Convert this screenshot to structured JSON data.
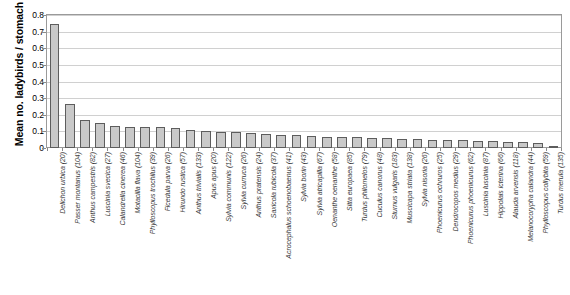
{
  "chart_data": {
    "type": "bar",
    "title": "",
    "subtitle": "",
    "xlabel": "",
    "ylabel": "Mean no. ladybirds / stomach",
    "ylim": [
      0,
      0.8
    ],
    "yticks": [
      "0",
      "0.1",
      "0.2",
      "0.3",
      "0.4",
      "0.5",
      "0.6",
      "0.7",
      "0.8"
    ],
    "ytick_values": [
      0,
      0.1,
      0.2,
      0.3,
      0.4,
      0.5,
      0.6,
      0.7,
      0.8
    ],
    "grid": true,
    "legend": "none",
    "bar_fill_color": "#c9c9c9",
    "bar_edge_color": "#5d5d5d",
    "categories": [
      "Delichon urbica (20)",
      "Passer montanus (104)",
      "Anthus campestris (82)",
      "Luscinia svecica (27)",
      "Calandrella cinerea (46)",
      "Motacilla flava (104)",
      "Phylloscopus trochilus (39)",
      "Ficedula parva (26)",
      "Hirundo rustica (57)",
      "Anthus trivialis (133)",
      "Apus apus (20)",
      "Sylvia communis (122)",
      "Sylvia curruca (26)",
      "Anthus pratensis (24)",
      "Saxicola rubicola (37)",
      "Acrocephalus schoenobaenus (41)",
      "Sylvia borin (43)",
      "Sylvia atricapilla (67)",
      "Oenanthe oenanthe (58)",
      "Sitta europaea (85)",
      "Turdus philomelos (79)",
      "Cuculus canorus (48)",
      "Sturnus vulgaris (183)",
      "Muscicapa striata (138)",
      "Sylvia nisoria (26)",
      "Phoenicurus ochruros (25)",
      "Dendrocopos medius (29)",
      "Phoenicurus phoenicurus (62)",
      "Luscinia luscinia (87)",
      "Hippolais icterina (66)",
      "Alauda arvensis (118)",
      "Melanocorypha calandra (44)",
      "Phylloscopus collybita (59)",
      "Turdus merula (135)"
    ],
    "values": [
      0.745,
      0.263,
      0.17,
      0.152,
      0.13,
      0.129,
      0.129,
      0.129,
      0.122,
      0.11,
      0.105,
      0.098,
      0.094,
      0.093,
      0.085,
      0.079,
      0.076,
      0.074,
      0.069,
      0.066,
      0.064,
      0.062,
      0.058,
      0.056,
      0.053,
      0.05,
      0.048,
      0.046,
      0.042,
      0.04,
      0.038,
      0.035,
      0.032,
      0.012
    ]
  }
}
